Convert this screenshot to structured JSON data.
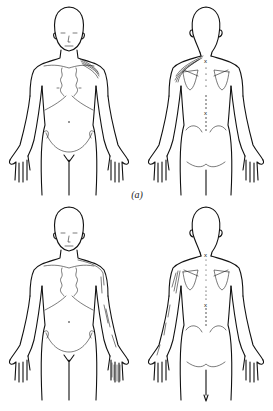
{
  "figure": {
    "panels": [
      {
        "id": "a",
        "caption": "(a)",
        "views": [
          "anterior",
          "posterior"
        ],
        "referral_region": "left shoulder / upper trapezius",
        "markers": [
          "x",
          "x"
        ]
      },
      {
        "id": "b",
        "caption": "(b)",
        "views": [
          "anterior",
          "posterior"
        ],
        "referral_region": "left shoulder, lateral arm and forearm to hand",
        "markers": [
          "x",
          "x"
        ]
      }
    ],
    "colors": {
      "line": "#111111",
      "background": "#ffffff"
    }
  }
}
